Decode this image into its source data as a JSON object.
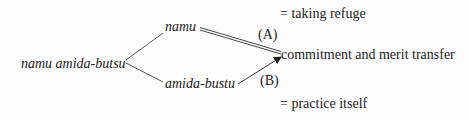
{
  "diagram": {
    "root": "namu amida-butsu",
    "branches": [
      {
        "label": "namu",
        "edge_label": "(A)",
        "edge_style": "double-line",
        "annotation": "= taking refuge"
      },
      {
        "label": "amida-bustu",
        "edge_label": "(B)",
        "edge_style": "arrow",
        "annotation": "= practice itself"
      }
    ],
    "target": "commitment and merit transfer"
  }
}
